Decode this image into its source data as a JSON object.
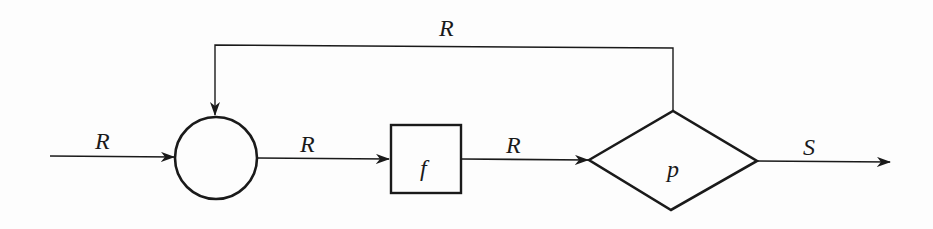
{
  "diagram": {
    "type": "flowchart",
    "stroke_color": "#1a1a1a",
    "nodes": [
      {
        "id": "junction",
        "shape": "circle",
        "label": ""
      },
      {
        "id": "f",
        "shape": "rectangle",
        "label": "f"
      },
      {
        "id": "p",
        "shape": "diamond",
        "label": "p"
      }
    ],
    "edges": [
      {
        "from": "input",
        "to": "junction",
        "label": "R"
      },
      {
        "from": "junction",
        "to": "f",
        "label": "R"
      },
      {
        "from": "f",
        "to": "p",
        "label": "R"
      },
      {
        "from": "p",
        "to": "output",
        "label": "S"
      },
      {
        "from": "p",
        "to": "junction",
        "label": "R",
        "kind": "feedback"
      }
    ]
  },
  "labels": {
    "input_edge": "R",
    "junction_to_f": "R",
    "f_to_p": "R",
    "feedback_edge": "R",
    "output_edge": "S",
    "f_node": "f",
    "p_node": "p"
  }
}
